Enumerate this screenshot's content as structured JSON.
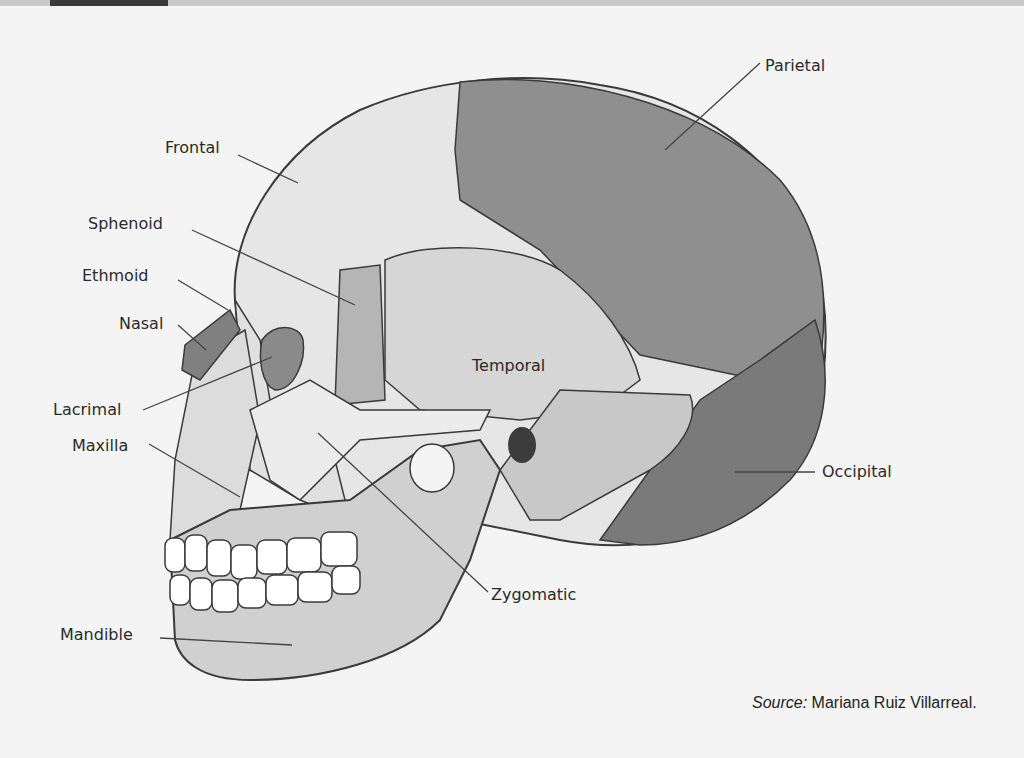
{
  "figure": {
    "labels": {
      "parietal": "Parietal",
      "frontal": "Frontal",
      "sphenoid": "Sphenoid",
      "ethmoid": "Ethmoid",
      "nasal": "Nasal",
      "temporal": "Temporal",
      "lacrimal": "Lacrimal",
      "maxilla": "Maxilla",
      "occipital": "Occipital",
      "zygomatic": "Zygomatic",
      "mandible": "Mandible"
    },
    "source_prefix": "Source:",
    "source_name": " Mariana Ruiz Villarreal."
  },
  "colors": {
    "parietal": "#8f8f8f",
    "frontal": "#e4e4e4",
    "temporal": "#d6d6d6",
    "occipital": "#7a7a7a",
    "outline": "#3a3a3a",
    "background": "#f4f4f4"
  }
}
